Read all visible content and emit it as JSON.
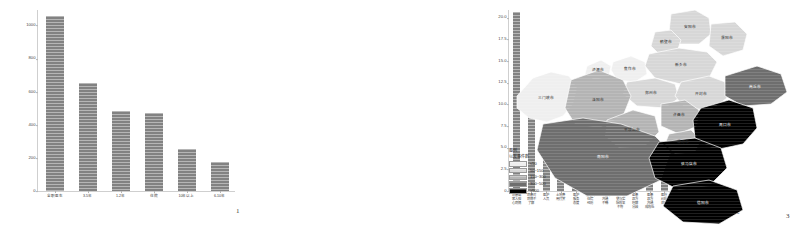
{
  "figure": {
    "panels": [
      {
        "id": "1",
        "number": "1"
      },
      {
        "id": "2",
        "number": "2"
      },
      {
        "id": "3",
        "number": "3"
      }
    ]
  },
  "chart_data": [
    {
      "type": "bar",
      "panel": "1",
      "title": "",
      "xlabel": "",
      "ylabel": "",
      "grid": false,
      "legend": "none",
      "ylim": [
        0,
        1100
      ],
      "yticks": [
        "0",
        "200",
        "400",
        "600",
        "800",
        "1000"
      ],
      "categories": [
        "全职医生",
        "3-5年",
        "1-2年",
        "住院",
        "10年以上",
        "6-10年"
      ],
      "values": [
        1060,
        650,
        485,
        470,
        255,
        175
      ]
    },
    {
      "type": "bar",
      "panel": "2",
      "title": "",
      "xlabel": "",
      "ylabel": "",
      "grid": false,
      "legend": "none",
      "ylim": [
        0,
        21
      ],
      "yticks": [
        "0",
        "2.5",
        "5.0",
        "7.5",
        "10.0",
        "12.5",
        "15.0",
        "17.5",
        "20.0"
      ],
      "categories": [
        "病患或\n家人担\n心病情",
        "病患对\n病情不\n了解",
        "医护\n人员",
        "土地费\n用打赏",
        "医护\n服务\n态度",
        "患者的\n住院\n经历",
        "医患间\n沟通\n不畅",
        "手术期\n望与实\n际效果\n不符",
        "医患\n双方\n理解\n分歧",
        "医患\n双方\n沟通\n成效低",
        "医疗\n纠纷\n处理",
        "就诊\n环境\n问题",
        "与家人\n朋友\n关系",
        "本院\n诊疗环\n境不佳",
        "身体\n条件\n不好"
      ],
      "values": [
        20.6,
        11.8,
        4.6,
        3.5,
        3.5,
        2.4,
        2.4,
        2.4,
        1.5,
        1.5,
        1.5,
        1.5,
        1.5,
        0.6,
        0.5
      ]
    }
  ],
  "map": {
    "panel": "3",
    "legend": {
      "title_line1": "图例",
      "title_line2": "以发事件数",
      "items": [
        {
          "label": "<50",
          "color": "#efefef"
        },
        {
          "label": "50~150",
          "color": "#d7d7d7"
        },
        {
          "label": "150~300",
          "color": "#b4b4b4"
        },
        {
          "label": "300~500",
          "color": "#6e6e6e"
        },
        {
          "label": ">500",
          "color": "#000000"
        }
      ]
    },
    "regions": [
      {
        "name": "三门峡市",
        "bin": 0
      },
      {
        "name": "济源市",
        "bin": 0
      },
      {
        "name": "焦作市",
        "bin": 0
      },
      {
        "name": "安阳市",
        "bin": 1
      },
      {
        "name": "鹤壁市",
        "bin": 1
      },
      {
        "name": "濮阳市",
        "bin": 1
      },
      {
        "name": "新乡市",
        "bin": 1
      },
      {
        "name": "郑州市",
        "bin": 1
      },
      {
        "name": "开封市",
        "bin": 1
      },
      {
        "name": "洛阳市",
        "bin": 2
      },
      {
        "name": "平顶山市",
        "bin": 2
      },
      {
        "name": "许昌市",
        "bin": 2
      },
      {
        "name": "漯河市",
        "bin": 2
      },
      {
        "name": "南阳市",
        "bin": 3
      },
      {
        "name": "商丘市",
        "bin": 3
      },
      {
        "name": "周口市",
        "bin": 4
      },
      {
        "name": "驻马店市",
        "bin": 4
      },
      {
        "name": "信阳市",
        "bin": 4
      }
    ]
  }
}
